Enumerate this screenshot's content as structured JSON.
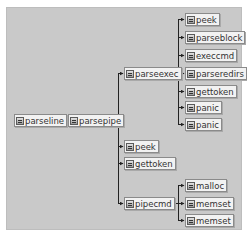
{
  "diagram": {
    "type": "call-graph",
    "colors": {
      "background": "#c9c9c9",
      "node_fill": "#f2f2f2",
      "node_border": "#8a8a8a",
      "edge": "#222222"
    },
    "nodes": [
      {
        "id": "parseline",
        "label": "parseline",
        "icon": "function-icon"
      },
      {
        "id": "parsepipe",
        "label": "parsepipe",
        "icon": "function-icon"
      },
      {
        "id": "parseexec",
        "label": "parseexec",
        "icon": "function-icon"
      },
      {
        "id": "peek1",
        "label": "peek",
        "icon": "function-icon"
      },
      {
        "id": "parseblock",
        "label": "parseblock",
        "icon": "function-icon"
      },
      {
        "id": "execcmd",
        "label": "execcmd",
        "icon": "function-icon"
      },
      {
        "id": "parseredirs",
        "label": "parseredirs",
        "icon": "function-icon"
      },
      {
        "id": "gettoken1",
        "label": "gettoken",
        "icon": "function-icon"
      },
      {
        "id": "panic1",
        "label": "panic",
        "icon": "function-icon"
      },
      {
        "id": "panic2",
        "label": "panic",
        "icon": "function-icon"
      },
      {
        "id": "peek2",
        "label": "peek",
        "icon": "function-icon"
      },
      {
        "id": "gettoken2",
        "label": "gettoken",
        "icon": "function-icon"
      },
      {
        "id": "pipecmd",
        "label": "pipecmd",
        "icon": "function-icon"
      },
      {
        "id": "malloc",
        "label": "malloc",
        "icon": "function-icon"
      },
      {
        "id": "memset1",
        "label": "memset",
        "icon": "function-icon"
      },
      {
        "id": "memset2",
        "label": "memset",
        "icon": "function-icon"
      }
    ],
    "edges": [
      [
        "parseline",
        "parsepipe"
      ],
      [
        "parsepipe",
        "parseexec"
      ],
      [
        "parsepipe",
        "peek2"
      ],
      [
        "parsepipe",
        "gettoken2"
      ],
      [
        "parsepipe",
        "pipecmd"
      ],
      [
        "parseexec",
        "peek1"
      ],
      [
        "parseexec",
        "parseblock"
      ],
      [
        "parseexec",
        "execcmd"
      ],
      [
        "parseexec",
        "parseredirs"
      ],
      [
        "parseexec",
        "gettoken1"
      ],
      [
        "parseexec",
        "panic1"
      ],
      [
        "parseexec",
        "panic2"
      ],
      [
        "pipecmd",
        "malloc"
      ],
      [
        "pipecmd",
        "memset1"
      ],
      [
        "pipecmd",
        "memset2"
      ]
    ]
  }
}
